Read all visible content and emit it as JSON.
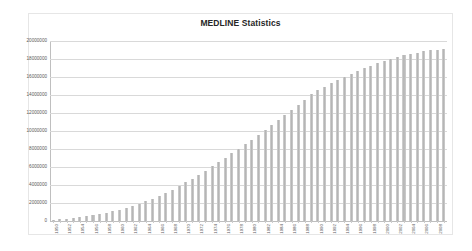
{
  "chart": {
    "title": "MEDLINE Statistics"
  },
  "chart_data": {
    "type": "bar",
    "title": "MEDLINE Statistics",
    "xlabel": "",
    "ylabel": "",
    "ylim": [
      0,
      20000000
    ],
    "ytick_step": 2000000,
    "yticks": [
      0,
      2000000,
      4000000,
      6000000,
      8000000,
      10000000,
      12000000,
      14000000,
      16000000,
      18000000,
      20000000
    ],
    "ytick_labels": [
      "0",
      "2000000",
      "4000000",
      "6000000",
      "8000000",
      "10000000",
      "12000000",
      "14000000",
      "16000000",
      "18000000",
      "20000000"
    ],
    "grid": true,
    "grid_axis": "y",
    "legend": false,
    "legend_position": "none",
    "bar_color": "#bfbfbf",
    "xtick_label_interval": 2,
    "xtick_label_rotation": -90,
    "categories": [
      "1950",
      "1951",
      "1952",
      "1953",
      "1954",
      "1955",
      "1956",
      "1957",
      "1958",
      "1959",
      "1960",
      "1961",
      "1962",
      "1963",
      "1964",
      "1965",
      "1966",
      "1967",
      "1968",
      "1969",
      "1970",
      "1971",
      "1972",
      "1973",
      "1974",
      "1975",
      "1976",
      "1977",
      "1978",
      "1979",
      "1980",
      "1981",
      "1982",
      "1983",
      "1984",
      "1985",
      "1986",
      "1987",
      "1988",
      "1989",
      "1990",
      "1991",
      "1992",
      "1993",
      "1994",
      "1995",
      "1996",
      "1997",
      "1998",
      "1999",
      "2000",
      "2001",
      "2002",
      "2003",
      "2004",
      "2005",
      "2006",
      "2007",
      "2008",
      "2009"
    ],
    "values": [
      120000,
      180000,
      250000,
      330000,
      420000,
      520000,
      630000,
      760000,
      900000,
      1060000,
      1240000,
      1440000,
      1660000,
      1900000,
      2170000,
      2460000,
      2780000,
      3120000,
      3490000,
      3880000,
      4290000,
      4720000,
      5160000,
      5610000,
      6070000,
      6540000,
      7020000,
      7510000,
      8010000,
      8520000,
      9040000,
      9560000,
      10090000,
      10630000,
      11180000,
      11740000,
      12310000,
      12890000,
      13480000,
      14080000,
      14530000,
      14910000,
      15280000,
      15640000,
      15990000,
      16330000,
      16650000,
      16960000,
      17250000,
      17520000,
      17770000,
      18000000,
      18210000,
      18400000,
      18570000,
      18720000,
      18850000,
      18960000,
      19050000,
      19120000
    ]
  }
}
